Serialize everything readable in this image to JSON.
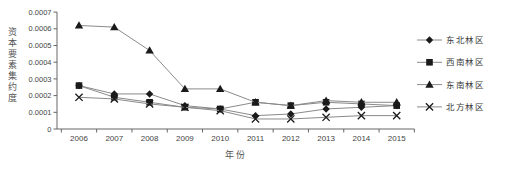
{
  "figure": {
    "background": "#ffffff",
    "axis_color": "#666666",
    "line_color": "#8a8a8a",
    "marker_color": "#1a1a1a",
    "tick_text_color": "#444444",
    "legend_text_color": "#3a3a3a"
  },
  "chart_data": {
    "type": "line",
    "title": "",
    "xlabel": "年份",
    "ylabel": "资本要素集约度",
    "x": [
      2006,
      2007,
      2008,
      2009,
      2010,
      2011,
      2012,
      2013,
      2014,
      2015
    ],
    "ylim": [
      0,
      0.0007
    ],
    "ytick_step": 0.0001,
    "ytick_labels": [
      "0",
      "0.0001",
      "0.0002",
      "0.0003",
      "0.0004",
      "0.0005",
      "0.0006",
      "0.0007"
    ],
    "grid": false,
    "legend_position": "right",
    "series": [
      {
        "name": "东北林区",
        "marker": "diamond",
        "values": [
          0.00026,
          0.00021,
          0.00021,
          0.00014,
          0.00012,
          8e-05,
          9e-05,
          0.00012,
          0.00013,
          0.00014
        ]
      },
      {
        "name": "西南林区",
        "marker": "square",
        "values": [
          0.00026,
          0.00019,
          0.00016,
          0.00013,
          0.00012,
          0.00016,
          0.00014,
          0.00016,
          0.00015,
          0.00014
        ]
      },
      {
        "name": "东南林区",
        "marker": "triangle",
        "values": [
          0.00062,
          0.00061,
          0.00047,
          0.00024,
          0.00024,
          0.00016,
          0.00014,
          0.00017,
          0.00016,
          0.00016
        ]
      },
      {
        "name": "北方林区",
        "marker": "x",
        "values": [
          0.00019,
          0.00018,
          0.00015,
          0.00013,
          0.00011,
          6e-05,
          6e-05,
          7e-05,
          8e-05,
          8e-05
        ]
      }
    ]
  }
}
